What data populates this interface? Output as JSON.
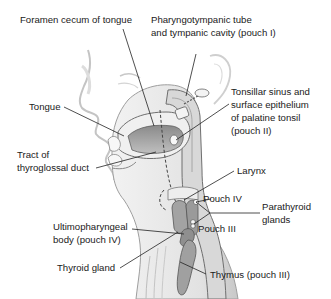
{
  "figure": {
    "colors": {
      "background": "#ffffff",
      "outline": "#555555",
      "tissue_light": "#e6e6e6",
      "tissue_mid": "#bdbdbd",
      "organ_fill": "#9a9a9a",
      "leader_line": "#222222",
      "text": "#1a1a1a"
    }
  },
  "labels": {
    "foramen_cecum": "Foramen cecum of tongue",
    "pharyngotympanic_1": "Pharyngotympanic tube",
    "pharyngotympanic_2": "and tympanic cavity (pouch I)",
    "tonsillar_1": "Tonsillar sinus and",
    "tonsillar_2": "surface epithelium",
    "tonsillar_3": "of palatine tonsil",
    "tonsillar_4": "(pouch II)",
    "tongue": "Tongue",
    "tract_1": "Tract of",
    "tract_2": "thyroglossal duct",
    "larynx": "Larynx",
    "pouch_iv": "Pouch IV",
    "parathyroid_1": "Parathyroid",
    "parathyroid_2": "glands",
    "ultimo_1": "Ultimopharyngeal",
    "ultimo_2": "body (pouch IV)",
    "pouch_iii": "Pouch III",
    "thyroid": "Thyroid gland",
    "thymus": "Thymus (pouch III)"
  }
}
